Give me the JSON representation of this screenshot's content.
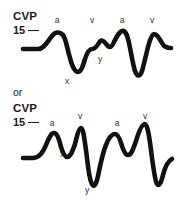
{
  "figure": {
    "background_color": "#ffffff",
    "ink_color": "#111111",
    "label_color": "#333333"
  },
  "traces": [
    {
      "id": "trace-normal",
      "axis_title": "CVP",
      "axis_value": "15",
      "tick_mark": "—",
      "wave_labels": [
        {
          "text": "a",
          "x": 57,
          "y": 16
        },
        {
          "text": "v",
          "x": 92,
          "y": 16
        },
        {
          "text": "a",
          "x": 122,
          "y": 16
        },
        {
          "text": "v",
          "x": 152,
          "y": 16
        },
        {
          "text": "x",
          "x": 67,
          "y": 77
        },
        {
          "text": "y",
          "x": 100,
          "y": 55
        }
      ],
      "path": "M 23 49 L 38 49 C 44 49 47 42 52 36 C 55 32 59 31 63 35 C 66 39 67 48 70 58 C 72 66 75 72 78 72 C 81 72 83 66 85 59 C 87 53 89 49 92 49 C 95 49 97 46 99 43 C 100 41 101 40 103 41 C 105 42 106 44 108 46 C 110 48 112 47 114 42 C 117 36 119 32 122 31 C 125 30 127 34 129 43 C 131 52 133 65 135 71 C 137 77 140 77 142 71 C 144 64 146 55 148 47 C 150 39 152 34 154 34 C 157 34 159 38 162 43 C 164 47 167 48 171 48"
    },
    {
      "id": "trace-abnormal",
      "axis_title": "CVP",
      "axis_value": "15",
      "tick_mark": "—",
      "wave_labels": [
        {
          "text": "a",
          "x": 52,
          "y": 119
        },
        {
          "text": "v",
          "x": 80,
          "y": 112
        },
        {
          "text": "a",
          "x": 117,
          "y": 119
        },
        {
          "text": "v",
          "x": 145,
          "y": 112
        },
        {
          "text": "x",
          "x": 62,
          "y": 150
        },
        {
          "text": "y",
          "x": 87,
          "y": 186
        }
      ],
      "path": "M 23 158 L 33 158 C 38 158 42 155 46 145 C 49 138 51 133 54 133 C 57 133 59 139 61 147 C 63 153 65 157 67 157 C 70 157 72 153 75 144 C 77 136 79 128 81 128 C 83 128 84 136 86 150 C 88 165 89 180 92 184 C 94 188 96 185 98 176 C 100 166 103 152 106 145 C 109 137 112 134 115 134 C 118 134 120 139 122 146 C 124 152 126 155 128 155 C 131 155 133 150 136 141 C 139 131 142 124 145 124 C 147 124 149 134 151 150 C 153 166 155 181 157 184 C 159 187 161 183 163 175 C 165 167 168 161 172 159"
    }
  ]
}
